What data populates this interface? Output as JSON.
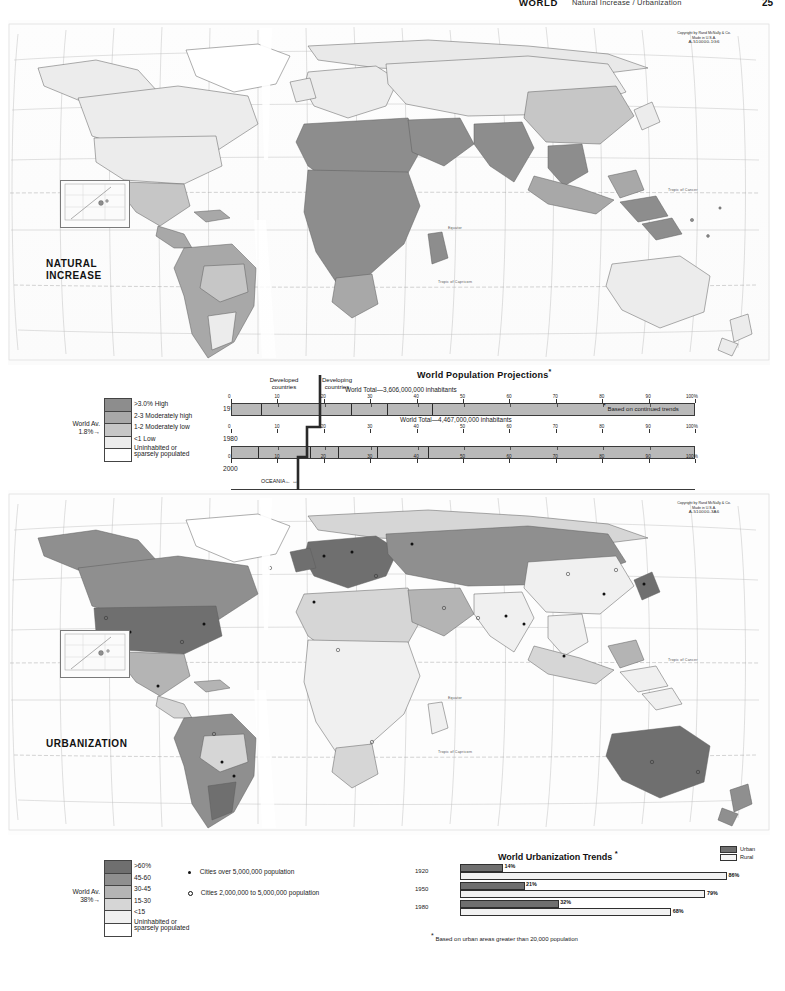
{
  "header": {
    "title": "WORLD",
    "subtitle": "Natural Increase / Urbanization",
    "page_number": "25"
  },
  "maps": [
    {
      "id": "natural-increase",
      "title_line1": "NATURAL",
      "title_line2": "INCREASE",
      "copyright_line1": "Copyright by Rand McNally & Co.",
      "copyright_line2": "Made in U.S.A.",
      "copyright_code": "A-510000-1G6",
      "graticule_labels": [
        "Tropic of Cancer",
        "Equator",
        "Tropic of Capricorn"
      ]
    },
    {
      "id": "urbanization",
      "title_line1": "URBANIZATION",
      "title_line2": "",
      "copyright_line1": "Copyright by Rand McNally & Co.",
      "copyright_line2": "Made in U.S.A.",
      "copyright_code": "A-510000-3A6",
      "graticule_labels": [
        "Tropic of Cancer",
        "Equator",
        "Tropic of Capricorn"
      ]
    }
  ],
  "natural_increase_legend": {
    "world_av_line1": "World Av.",
    "world_av_line2": "1.8%",
    "arrow": "→",
    "items": [
      {
        "label": ">3.0% High",
        "color": "#8d8d8d"
      },
      {
        "label": "2-3 Moderately high",
        "color": "#a8a8a8"
      },
      {
        "label": "1-2 Moderately low",
        "color": "#c6c6c6"
      },
      {
        "label": "<1 Low",
        "color": "#ececec"
      },
      {
        "label": "Uninhabited or sparsely populated",
        "label_line1": "Uninhabited or",
        "label_line2": "sparsely populated",
        "color": "#ffffff"
      }
    ]
  },
  "urbanization_legend": {
    "world_av_line1": "World Av.",
    "world_av_line2": "38%",
    "arrow": "→",
    "items": [
      {
        "label": ">60%",
        "color": "#6f6f6f"
      },
      {
        "label": "45-60",
        "color": "#8f8f8f"
      },
      {
        "label": "30-45",
        "color": "#b4b4b4"
      },
      {
        "label": "15-30",
        "color": "#d6d6d6"
      },
      {
        "label": "<15",
        "color": "#f0f0f0"
      },
      {
        "label": "Uninhabited or sparsely populated",
        "label_line1": "Uninhabited or",
        "label_line2": "sparsely populated",
        "color": "#ffffff"
      }
    ],
    "city_keys": [
      {
        "symbol": "filled-dot",
        "label": "Cities over 5,000,000 population"
      },
      {
        "symbol": "open-dot",
        "label": "Cities 2,000,000 to 5,000,000 population"
      }
    ]
  },
  "chart_data": [
    {
      "type": "bar",
      "id": "world-population-projections",
      "title": "World Population Projections",
      "title_footnote_marker": "*",
      "footnote": "Based on continued trends",
      "orientation": "horizontal-stacked-100pct",
      "group_labels": [
        {
          "text_line1": "Developed",
          "text_line2": "countries"
        },
        {
          "text_line1": "Developing",
          "text_line2": "countries"
        }
      ],
      "divider_pct": 25.5,
      "xlabel": "",
      "ylabel": "",
      "xlim": [
        0,
        100
      ],
      "tick_labels": [
        "0",
        "10",
        "20",
        "30",
        "40",
        "50",
        "60",
        "70",
        "80",
        "90",
        "100%"
      ],
      "tick_values": [
        0,
        10,
        20,
        30,
        40,
        50,
        60,
        70,
        80,
        90,
        100
      ],
      "rows": [
        {
          "year": "1970",
          "world_total_text": "World Total—3,606,000,000 inhabitants",
          "world_total_value": 3606000000,
          "show_ticks": true,
          "segments": [
            {
              "name": "N. AM.",
              "value": 6.2,
              "show_label": false
            },
            {
              "name": "EUROPE",
              "value": 12.8,
              "show_label": false
            },
            {
              "name": "SOV. UN.",
              "value": 6.6,
              "show_label": false
            },
            {
              "name": "LATIN AM.",
              "value": 7.8,
              "show_label": false
            },
            {
              "name": "AFRICA",
              "value": 9.8,
              "show_label": false
            },
            {
              "name": "ASIA",
              "value": 56.8,
              "show_label": false
            }
          ]
        },
        {
          "year": "1980",
          "world_total_text": "World Total—4,467,000,000 inhabitants",
          "world_total_value": 4467000000,
          "show_ticks": true,
          "segments": [
            {
              "name": "N. AM.",
              "value": 5.6,
              "show_label": false
            },
            {
              "name": "EUROPE",
              "value": 11.2,
              "show_label": false
            },
            {
              "name": "SOV. UN.",
              "value": 6.0,
              "show_label": false
            },
            {
              "name": "LATIN AM.",
              "value": 8.4,
              "show_label": false
            },
            {
              "name": "AFRICA",
              "value": 11.0,
              "show_label": false
            },
            {
              "name": "ASIA",
              "value": 57.8,
              "show_label": false
            }
          ]
        },
        {
          "year": "2000",
          "world_total_text": "World Total—7,410,000,000 inhabitants",
          "world_total_value": 7410000000,
          "show_ticks": true,
          "segments": [
            {
              "name": "N. AM.",
              "value": 4.6,
              "show_label": true
            },
            {
              "name": "EUROPE",
              "value": 8.6,
              "show_label": true
            },
            {
              "name": "SOV. UN.",
              "value": 4.7,
              "show_label": true,
              "small": true
            },
            {
              "name": "LATIN AM.",
              "value": 9.4,
              "show_label": true
            },
            {
              "name": "AFRICA",
              "value": 12.4,
              "show_label": true
            },
            {
              "name": "ASIA",
              "value": 60.3,
              "show_label": true
            }
          ],
          "oceania_note": "OCEANIA"
        }
      ]
    },
    {
      "type": "bar",
      "id": "world-urbanization-trends",
      "title": "World  Urbanization Trends",
      "title_footnote_marker": "*",
      "footnote": "Based on urban areas greater than  20,000 population",
      "orientation": "horizontal-paired",
      "legend": [
        {
          "label": "Urban",
          "color": "#6f6f6f"
        },
        {
          "label": "Rural",
          "color": "#f5f5f5"
        }
      ],
      "categories": [
        "1920",
        "1950",
        "1980"
      ],
      "series": [
        {
          "name": "Urban",
          "values": [
            14,
            21,
            32
          ],
          "labels": [
            "14%",
            "21%",
            "32%"
          ]
        },
        {
          "name": "Rural",
          "values": [
            86,
            79,
            68
          ],
          "labels": [
            "86%",
            "79%",
            "68%"
          ]
        }
      ],
      "xlim": [
        0,
        100
      ]
    }
  ]
}
